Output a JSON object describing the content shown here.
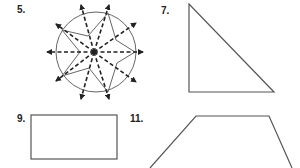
{
  "problems": [
    {
      "number": "5.",
      "figure": "five-point-star-in-circle-with-symmetry-lines"
    },
    {
      "number": "7.",
      "figure": "right-triangle"
    },
    {
      "number": "9.",
      "figure": "rectangle"
    },
    {
      "number": "11.",
      "figure": "trapezoid"
    }
  ],
  "colors": {
    "stroke": "#555555",
    "dash": "#222222",
    "text": "#222222"
  }
}
